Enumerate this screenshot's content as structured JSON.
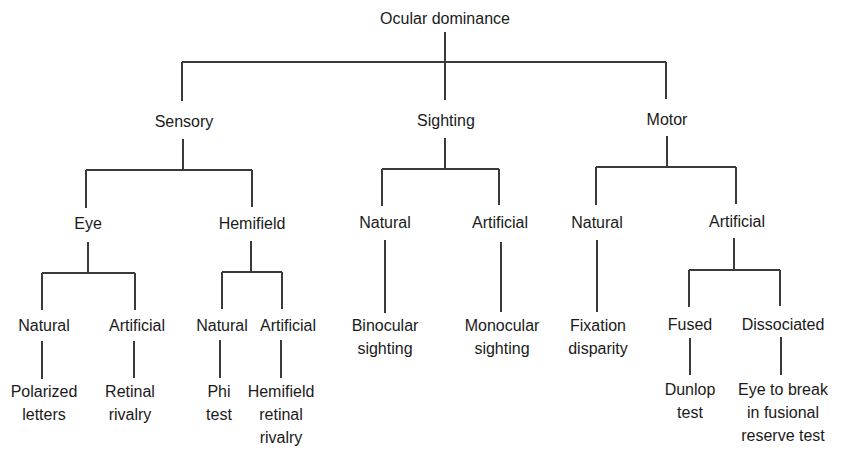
{
  "diagram": {
    "type": "tree",
    "title": "Ocular dominance",
    "root": {
      "label": "Ocular dominance",
      "children": [
        {
          "label": "Sensory",
          "children": [
            {
              "label": "Eye",
              "children": [
                {
                  "label": "Natural",
                  "children": [
                    {
                      "label": "Polarized letters"
                    }
                  ]
                },
                {
                  "label": "Artificial",
                  "children": [
                    {
                      "label": "Retinal rivalry"
                    }
                  ]
                }
              ]
            },
            {
              "label": "Hemifield",
              "children": [
                {
                  "label": "Natural",
                  "children": [
                    {
                      "label": "Phi test"
                    }
                  ]
                },
                {
                  "label": "Artificial",
                  "children": [
                    {
                      "label": "Hemifield retinal rivalry"
                    }
                  ]
                }
              ]
            }
          ]
        },
        {
          "label": "Sighting",
          "children": [
            {
              "label": "Natural",
              "children": [
                {
                  "label": "Binocular sighting"
                }
              ]
            },
            {
              "label": "Artificial",
              "children": [
                {
                  "label": "Monocular sighting"
                }
              ]
            }
          ]
        },
        {
          "label": "Motor",
          "children": [
            {
              "label": "Natural",
              "children": [
                {
                  "label": "Fixation disparity"
                }
              ]
            },
            {
              "label": "Artificial",
              "children": [
                {
                  "label": "Fused",
                  "children": [
                    {
                      "label": "Dunlop test"
                    }
                  ]
                },
                {
                  "label": "Dissociated",
                  "children": [
                    {
                      "label": "Eye to break in fusional reserve test"
                    }
                  ]
                }
              ]
            }
          ]
        }
      ]
    }
  },
  "labels": {
    "root": "Ocular dominance",
    "sensory": "Sensory",
    "sighting": "Sighting",
    "motor": "Motor",
    "eye": "Eye",
    "hemifield": "Hemifield",
    "sighting_natural": "Natural",
    "sighting_artificial": "Artificial",
    "motor_natural": "Natural",
    "motor_artificial": "Artificial",
    "eye_natural": "Natural",
    "eye_artificial": "Artificial",
    "hemi_natural": "Natural",
    "hemi_artificial": "Artificial",
    "fused": "Fused",
    "dissociated": "Dissociated",
    "polarized_letters": [
      "Polarized",
      "letters"
    ],
    "retinal_rivalry": [
      "Retinal",
      "rivalry"
    ],
    "phi_test": [
      "Phi",
      "test"
    ],
    "hemifield_retinal_rivalry": [
      "Hemifield",
      "retinal",
      "rivalry"
    ],
    "binocular_sighting": [
      "Binocular",
      "sighting"
    ],
    "monocular_sighting": [
      "Monocular",
      "sighting"
    ],
    "fixation_disparity": [
      "Fixation",
      "disparity"
    ],
    "dunlop_test": [
      "Dunlop",
      "test"
    ],
    "eye_to_break": [
      "Eye to break",
      "in fusional",
      "reserve test"
    ]
  },
  "colors": {
    "line": "#3a3a3a",
    "text": "#1a1a1a",
    "background": "#ffffff"
  }
}
